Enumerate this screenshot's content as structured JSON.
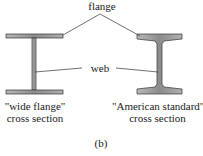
{
  "labels": {
    "flange": "flange",
    "web": "web",
    "left_caption_line1": "\"wide flange\"",
    "left_caption_line2": "cross section",
    "right_caption_line1": "\"American standard\"",
    "right_caption_line2": "cross section",
    "figure_label": "(b)"
  },
  "colors": {
    "beam_fill": "#9a9a9a",
    "beam_stroke": "#333333",
    "leader_line": "#333333"
  }
}
